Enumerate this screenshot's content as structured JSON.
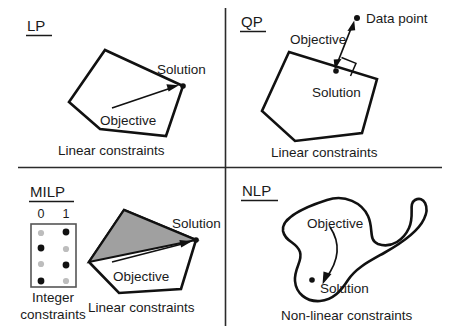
{
  "figure": {
    "background": "#ffffff",
    "ink_color": "#111111",
    "shade_color": "#a0a0a0"
  },
  "quadrants": {
    "lp": {
      "label": "LP",
      "annotations": {
        "solution": "Solution",
        "objective": "Objective",
        "constraints": "Linear constraints"
      }
    },
    "qp": {
      "label": "QP",
      "annotations": {
        "data_point": "Data point",
        "objective": "Objective",
        "solution": "Solution",
        "constraints": "Linear constraints"
      }
    },
    "milp": {
      "label": "MILP",
      "annotations": {
        "solution": "Solution",
        "objective": "Objective",
        "constraints": "Linear constraints",
        "integer_caption_line1": "Integer",
        "integer_caption_line2": "constraints"
      },
      "integer_grid": {
        "column_headers": [
          "0",
          "1"
        ],
        "rows": [
          [
            "light",
            "dark"
          ],
          [
            "dark",
            "light"
          ],
          [
            "light",
            "dark"
          ],
          [
            "dark",
            "light"
          ]
        ]
      }
    },
    "nlp": {
      "label": "NLP",
      "annotations": {
        "objective": "Objective",
        "solution": "Solution",
        "constraints": "Non-linear constraints"
      }
    }
  }
}
